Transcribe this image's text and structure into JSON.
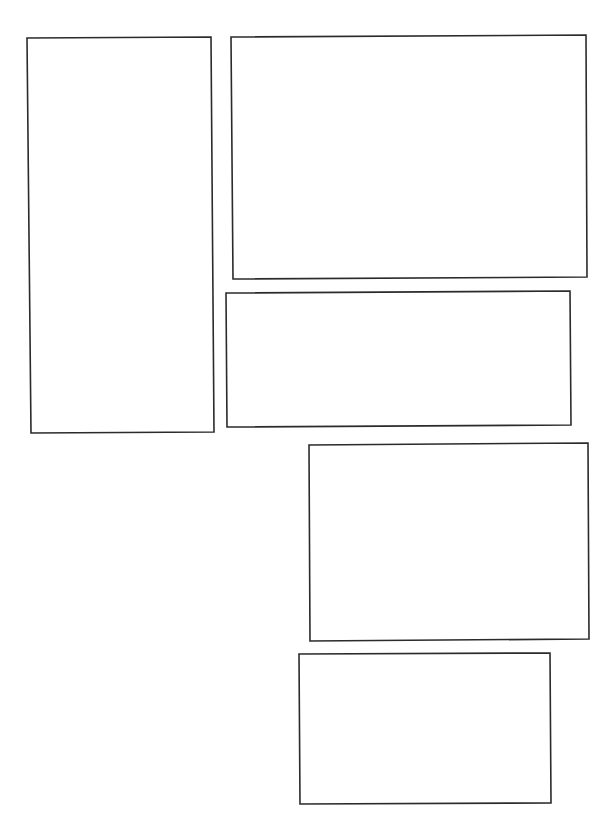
{
  "page": {
    "type": "comic-page-panel-layout",
    "background": "#ffffff",
    "border_color": "#2b2b2b",
    "panel_count": 5
  },
  "panels": [
    {
      "id": "panel-1",
      "points": "27,38 211,37 214,432 31,433",
      "content": ""
    },
    {
      "id": "panel-2",
      "points": "231,37 586,35 587,277 233,279",
      "content": ""
    },
    {
      "id": "panel-3",
      "points": "226,293 570,291 571,425 227,427",
      "content": ""
    },
    {
      "id": "panel-4",
      "points": "309,445 588,443 589,639 310,641",
      "content": ""
    },
    {
      "id": "panel-5",
      "points": "299,654 550,653 551,803 300,804",
      "content": ""
    }
  ]
}
